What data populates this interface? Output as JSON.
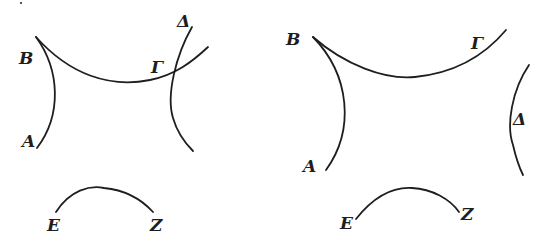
{
  "figure": {
    "stroke_color": "#1e1e1e",
    "background": "#ffffff"
  },
  "left_figure": {
    "labels": {
      "A": "A",
      "B": "B",
      "G": "Γ",
      "D": "Δ",
      "E": "E",
      "Z": "Z"
    },
    "arcs": [
      {
        "name": "arc-AB",
        "endpoints": [
          "A",
          "B"
        ]
      },
      {
        "name": "arc-BG",
        "endpoints": [
          "B",
          "Γ"
        ]
      },
      {
        "name": "arc-D",
        "endpoints": [
          "Δ",
          ""
        ]
      },
      {
        "name": "arc-EZ",
        "endpoints": [
          "E",
          "Z"
        ]
      }
    ]
  },
  "right_figure": {
    "labels": {
      "A": "A",
      "B": "B",
      "G": "Γ",
      "D": "Δ",
      "E": "E",
      "Z": "Z"
    },
    "arcs": [
      {
        "name": "arc-AB",
        "endpoints": [
          "A",
          "B"
        ]
      },
      {
        "name": "arc-BG",
        "endpoints": [
          "B",
          "Γ"
        ]
      },
      {
        "name": "arc-D",
        "endpoints": [
          "Δ",
          ""
        ]
      },
      {
        "name": "arc-EZ",
        "endpoints": [
          "E",
          "Z"
        ]
      }
    ]
  }
}
